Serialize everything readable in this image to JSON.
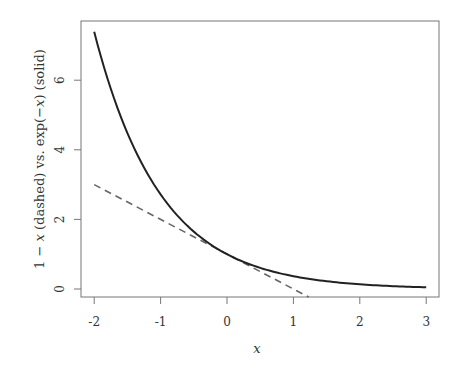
{
  "chart_data": {
    "type": "line",
    "title": "",
    "xlabel": "x",
    "ylabel": "1 − x (dashed) vs. exp(−x) (solid)",
    "xlim": [
      -2.2,
      3.2
    ],
    "ylim": [
      -0.25,
      7.65
    ],
    "x_ticks": [
      "-2",
      "-1",
      "0",
      "1",
      "2",
      "3"
    ],
    "y_ticks": [
      "0",
      "2",
      "4",
      "6"
    ],
    "grid": false,
    "legend": null,
    "series": [
      {
        "name": "exp(-x)",
        "style": "solid",
        "color": "#222222",
        "x": [
          -2,
          -1.75,
          -1.5,
          -1.25,
          -1,
          -0.75,
          -0.5,
          -0.25,
          0,
          0.25,
          0.5,
          0.75,
          1,
          1.5,
          2,
          2.5,
          3
        ],
        "y": [
          7.389,
          5.755,
          4.482,
          3.49,
          2.718,
          2.117,
          1.649,
          1.284,
          1.0,
          0.779,
          0.607,
          0.472,
          0.368,
          0.223,
          0.135,
          0.082,
          0.05
        ]
      },
      {
        "name": "1 - x",
        "style": "dashed",
        "color": "#666666",
        "x": [
          -2,
          1.23
        ],
        "y": [
          3,
          -0.23
        ]
      }
    ]
  },
  "axes": {
    "x_label": "x",
    "y_label_parts": [
      "1 − ",
      "x",
      " (dashed) vs. exp(−",
      "x",
      ") (solid)"
    ],
    "x_tick_labels": [
      "-2",
      "-1",
      "0",
      "1",
      "2",
      "3"
    ],
    "y_tick_labels": [
      "0",
      "2",
      "4",
      "6"
    ]
  },
  "colors": {
    "solid_line": "#222222",
    "dashed_line": "#666666",
    "frame": "#777777",
    "text": "#333333"
  }
}
